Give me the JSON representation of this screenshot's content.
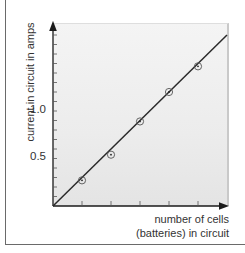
{
  "chart_data": {
    "type": "scatter",
    "title": "",
    "xlabel": "number of cells (batteries) in circuit",
    "xlabel_lines": [
      "number of cells",
      "(batteries) in circuit"
    ],
    "ylabel": "current in circuit in amps",
    "x": [
      1,
      2,
      3,
      4,
      5
    ],
    "series": [
      {
        "name": "measured current",
        "values": [
          0.27,
          0.54,
          0.89,
          1.2,
          1.47
        ],
        "marker": "circled-dot"
      },
      {
        "name": "best-fit line",
        "type": "line",
        "from": [
          0,
          0
        ],
        "to": [
          6.0,
          1.8
        ]
      }
    ],
    "yticks_labeled": [
      {
        "value": 0.5,
        "label": "0.5"
      },
      {
        "value": 1.0,
        "label": "1.0"
      }
    ],
    "ytick_minor_step": 0.1,
    "xticks": [
      1,
      2,
      3,
      4,
      5
    ],
    "xtick_labels": [],
    "xlim": [
      0,
      6.1
    ],
    "ylim": [
      0,
      1.95
    ],
    "grid": false,
    "legend": "none"
  },
  "labels": {
    "y_axis": "current in circuit in amps",
    "x_axis_line1": "number of cells",
    "x_axis_line2": "(batteries) in circuit",
    "tick_0_5": "0.5",
    "tick_1_0": "1.0"
  },
  "colors": {
    "line": "#2a2a2a",
    "axis": "#1a1a1a",
    "marker": "#555555",
    "plot_bg": "#ececec"
  }
}
